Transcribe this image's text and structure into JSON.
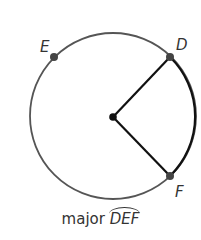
{
  "diagram": {
    "type": "circle-arc",
    "center": {
      "x": 113,
      "y": 116
    },
    "radius": 83,
    "colors": {
      "circle": "#555555",
      "highlight": "#111111",
      "point": "#444444"
    },
    "points": [
      {
        "label": "E",
        "x": 54,
        "y": 57
      },
      {
        "label": "D",
        "x": 170,
        "y": 57
      },
      {
        "label": "F",
        "x": 170,
        "y": 176
      }
    ],
    "caption": {
      "prefix": "major",
      "arc": "DEF"
    }
  }
}
